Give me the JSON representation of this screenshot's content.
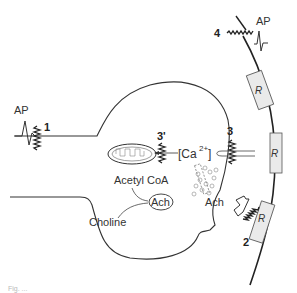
{
  "diagram": {
    "labels": {
      "ap_left": "AP",
      "ap_right": "AP",
      "site_1": "1",
      "site_2": "2",
      "site_3": "3",
      "site_3_prime": "3'",
      "site_4": "4",
      "calcium": "[Ca",
      "calcium_sup": "2+",
      "calcium_close": "]",
      "acetyl_coa": "Acetyl  CoA",
      "ach_inner": "Ach",
      "ach_release": "Ach",
      "choline": "Choline",
      "receptor_1": "R",
      "receptor_2": "R",
      "receptor_3": "R"
    },
    "caption": "Fig. ..."
  }
}
